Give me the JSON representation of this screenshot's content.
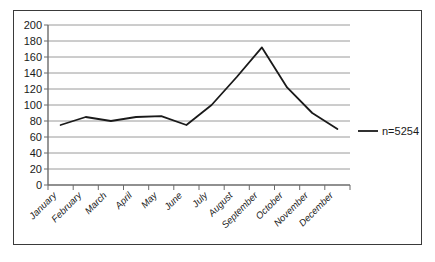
{
  "chart_data": {
    "type": "line",
    "title": "",
    "subtitle": "",
    "xlabel": "",
    "ylabel": "",
    "categories": [
      "January",
      "February",
      "March",
      "April",
      "May",
      "June",
      "July",
      "August",
      "September",
      "October",
      "November",
      "December"
    ],
    "series": [
      {
        "name": "n=5254",
        "values": [
          75,
          85,
          80,
          85,
          86,
          75,
          100,
          135,
          172,
          122,
          90,
          70
        ],
        "color": "#1a1a1a"
      }
    ],
    "ylim": [
      0,
      200
    ],
    "ytick_labels": [
      "0",
      "20",
      "40",
      "60",
      "80",
      "100",
      "120",
      "140",
      "160",
      "180",
      "200"
    ],
    "ytick_values": [
      0,
      20,
      40,
      60,
      80,
      100,
      120,
      140,
      160,
      180,
      200
    ],
    "grid": true,
    "grid_axis": "y",
    "grid_color": "#9a9a9a",
    "legend": {
      "position": "right",
      "entries": [
        {
          "label": "n=5254",
          "color": "#1a1a1a",
          "marker": "line"
        }
      ]
    },
    "axis_color": "#6b6b6b",
    "plot_background": "#ffffff",
    "xtick_label_rotation": -45
  },
  "frame": {
    "border_color": "#3a3a3a"
  }
}
